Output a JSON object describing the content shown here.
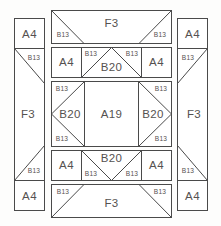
{
  "diagram": {
    "type": "quilt-block-layout",
    "background_color": "#fdfdfc",
    "line_color": "#4a4a4a",
    "label_color": "#555250",
    "patch_codes": {
      "corner_square": "A4",
      "center_square": "A19",
      "triangle_small": "B13",
      "triangle_large": "B20",
      "trapezoid": "F3"
    },
    "corners": {
      "top_left": "A4",
      "top_right": "A4",
      "bottom_left": "A4",
      "bottom_right": "A4"
    },
    "side_panels": {
      "left": {
        "center": "F3",
        "top_triangle": "B13",
        "bottom_triangle": "B13"
      },
      "right": {
        "center": "F3",
        "top_triangle": "B13",
        "bottom_triangle": "B13"
      }
    },
    "center_block": {
      "bands": [
        {
          "name": "top-band",
          "center": "F3",
          "left_triangle": "B13",
          "right_triangle": "B13"
        },
        {
          "name": "upper-inner-band",
          "left_square": "A4",
          "right_square": "A4",
          "center_triangle": "B20",
          "left_triangle": "B13",
          "right_triangle": "B13"
        },
        {
          "name": "middle-band",
          "center": "A19",
          "left_triangle": "B20",
          "right_triangle": "B20",
          "left_corner_top": "B13",
          "left_corner_bottom": "B13",
          "right_corner_top": "B13",
          "right_corner_bottom": "B13"
        },
        {
          "name": "lower-inner-band",
          "left_square": "A4",
          "right_square": "A4",
          "center_triangle": "B20",
          "left_triangle": "B13",
          "right_triangle": "B13"
        },
        {
          "name": "bottom-band",
          "center": "F3",
          "left_triangle": "B13",
          "right_triangle": "B13"
        }
      ]
    },
    "labels": {
      "tl_corner": "A4",
      "tr_corner": "A4",
      "bl_corner": "A4",
      "br_corner": "A4",
      "left_panel_center": "F3",
      "left_panel_top_tri": "B13",
      "left_panel_bottom_tri": "B13",
      "right_panel_center": "F3",
      "right_panel_top_tri": "B13",
      "right_panel_bottom_tri": "B13",
      "top_band_center": "F3",
      "top_band_left_tri": "B13",
      "top_band_right_tri": "B13",
      "upper_left_sq": "A4",
      "upper_right_sq": "A4",
      "upper_center_tri": "B20",
      "upper_left_tri": "B13",
      "upper_right_tri": "B13",
      "mid_center": "A19",
      "mid_left_tri": "B20",
      "mid_right_tri": "B20",
      "mid_left_tl": "B13",
      "mid_left_bl": "B13",
      "mid_right_tr": "B13",
      "mid_right_br": "B13",
      "lower_left_sq": "A4",
      "lower_right_sq": "A4",
      "lower_center_tri": "B20",
      "lower_left_tri": "B13",
      "lower_right_tri": "B13",
      "bottom_band_center": "F3",
      "bottom_band_left_tri": "B13",
      "bottom_band_right_tri": "B13"
    }
  }
}
